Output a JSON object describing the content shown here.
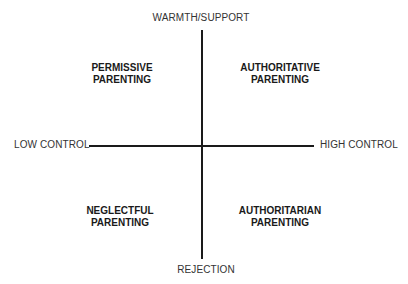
{
  "diagram": {
    "type": "quadrant",
    "axes": {
      "vertical": {
        "top_label": "WARMTH/SUPPORT",
        "bottom_label": "REJECTION"
      },
      "horizontal": {
        "left_label": "LOW CONTROL",
        "right_label": "HIGH CONTROL"
      }
    },
    "quadrants": {
      "top_left": {
        "line1": "PERMISSIVE",
        "line2": "PARENTING"
      },
      "top_right": {
        "line1": "AUTHORITATIVE",
        "line2": "PARENTING"
      },
      "bottom_left": {
        "line1": "NEGLECTFUL",
        "line2": "PARENTING"
      },
      "bottom_right": {
        "line1": "AUTHORITARIAN",
        "line2": "PARENTING"
      }
    },
    "colors": {
      "line": "#1a1a1a",
      "text": "#222222",
      "background": "#ffffff"
    }
  }
}
